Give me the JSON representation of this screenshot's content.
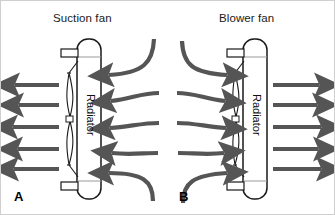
{
  "figure": {
    "width": 335,
    "height": 215,
    "background": "#ffffff",
    "border_color": "#cfcfcf",
    "arrow_color": "#555555",
    "outline_color": "#1a1a1a",
    "type": "technical-diagram"
  },
  "panels": [
    {
      "letter": "A",
      "title": "Suction fan",
      "radiator_label": "Radiator",
      "fan_side": "left",
      "airflow_direction": "left",
      "inlet_arrows": 5,
      "outlet_arrows": 5
    },
    {
      "letter": "B",
      "title": "Blower fan",
      "radiator_label": "Radiator",
      "fan_side": "left",
      "airflow_direction": "right",
      "inlet_arrows": 5,
      "outlet_arrows": 5
    }
  ],
  "icons": {
    "arrow": "arrow-icon",
    "curved_arrow": "curved-arrow-icon",
    "radiator": "radiator-icon",
    "fan": "fan-blade-icon",
    "pipe": "pipe-stub-icon"
  }
}
